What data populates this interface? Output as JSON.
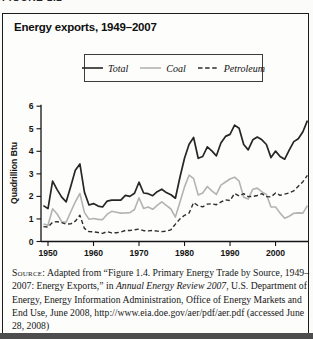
{
  "page": {
    "clipped_header": "FIGURE 1.2"
  },
  "figure": {
    "title": "Energy exports, 1949–2007",
    "y_axis_label": "Quadrillion Btu",
    "colors": {
      "total_line": "#262626",
      "coal_line": "#b3b3b3",
      "petroleum_line": "#2e2e2e",
      "border": "#1c1c1c",
      "bottom_rule": "#4d4d4d"
    },
    "legend": [
      {
        "label": "Total",
        "dash": "solid",
        "color": "#262626"
      },
      {
        "label": "Coal",
        "dash": "solid",
        "color": "#b3b3b3"
      },
      {
        "label": "Petroleum",
        "dash": "dashed",
        "color": "#2e2e2e"
      }
    ],
    "source_segments": [
      {
        "text": "Source:",
        "style": "smallcaps"
      },
      {
        "text": " Adapted from “Figure 1.4. Primary Energy Trade by Source, 1949–2007: Energy Exports,” in ",
        "style": "normal"
      },
      {
        "text": "Annual Energy Review 2007",
        "style": "italic"
      },
      {
        "text": ", U.S. Department of Energy, Energy Information Administration, Office of Energy Markets and End Use, June 2008, http://www.eia.doe.gov/aer/pdf/aer.pdf (accessed June 28, 2008)",
        "style": "normal"
      }
    ]
  },
  "chart_data": {
    "type": "line",
    "title": "Energy exports, 1949–2007",
    "xlabel": "",
    "ylabel": "Quadrillion Btu",
    "ylim": [
      0,
      6
    ],
    "xlim": [
      1949,
      2007
    ],
    "grid": false,
    "legend_position": "top-center",
    "x_ticks": [
      1950,
      1960,
      1970,
      1980,
      1990,
      2000
    ],
    "y_ticks": [
      0,
      1,
      2,
      3,
      4,
      5,
      6
    ],
    "x": [
      1949,
      1950,
      1951,
      1952,
      1953,
      1954,
      1955,
      1956,
      1957,
      1958,
      1959,
      1960,
      1961,
      1962,
      1963,
      1964,
      1965,
      1966,
      1967,
      1968,
      1969,
      1970,
      1971,
      1972,
      1973,
      1974,
      1975,
      1976,
      1977,
      1978,
      1979,
      1980,
      1981,
      1982,
      1983,
      1984,
      1985,
      1986,
      1987,
      1988,
      1989,
      1990,
      1991,
      1992,
      1993,
      1994,
      1995,
      1996,
      1997,
      1998,
      1999,
      2000,
      2001,
      2002,
      2003,
      2004,
      2005,
      2006,
      2007
    ],
    "series": [
      {
        "name": "Total",
        "color": "#262626",
        "dash": "solid",
        "values": [
          1.59,
          1.46,
          2.68,
          2.3,
          1.97,
          1.76,
          2.45,
          3.16,
          3.44,
          2.19,
          1.62,
          1.68,
          1.57,
          1.53,
          1.79,
          1.83,
          1.83,
          1.83,
          2.05,
          2.0,
          2.14,
          2.63,
          2.15,
          2.12,
          2.03,
          2.21,
          2.32,
          2.17,
          2.07,
          1.92,
          2.86,
          3.69,
          4.31,
          4.61,
          3.69,
          3.77,
          4.2,
          4.02,
          3.8,
          4.37,
          4.66,
          4.75,
          5.16,
          5.02,
          4.3,
          4.06,
          4.51,
          4.63,
          4.51,
          4.3,
          3.72,
          4.01,
          3.77,
          3.65,
          4.05,
          4.43,
          4.56,
          4.87,
          5.36
        ]
      },
      {
        "name": "Coal",
        "color": "#b3b3b3",
        "dash": "solid",
        "values": [
          0.78,
          0.72,
          1.45,
          1.22,
          0.88,
          0.86,
          1.32,
          1.76,
          2.13,
          1.29,
          0.99,
          1.02,
          0.98,
          0.97,
          1.21,
          1.34,
          1.3,
          1.26,
          1.27,
          1.28,
          1.42,
          1.94,
          1.47,
          1.53,
          1.43,
          1.6,
          1.76,
          1.6,
          1.44,
          1.08,
          1.75,
          2.42,
          2.94,
          2.79,
          2.06,
          2.15,
          2.44,
          2.25,
          2.09,
          2.5,
          2.64,
          2.77,
          2.85,
          2.68,
          1.96,
          1.88,
          2.32,
          2.37,
          2.2,
          2.09,
          1.53,
          1.53,
          1.26,
          1.03,
          1.12,
          1.25,
          1.27,
          1.26,
          1.59
        ]
      },
      {
        "name": "Petroleum",
        "color": "#2e2e2e",
        "dash": "dashed",
        "values": [
          0.66,
          0.64,
          0.86,
          0.88,
          0.84,
          0.77,
          0.78,
          0.9,
          1.16,
          0.58,
          0.44,
          0.43,
          0.4,
          0.36,
          0.44,
          0.38,
          0.39,
          0.42,
          0.49,
          0.49,
          0.52,
          0.55,
          0.48,
          0.47,
          0.49,
          0.46,
          0.44,
          0.46,
          0.52,
          0.77,
          1.0,
          1.16,
          1.26,
          1.73,
          1.58,
          1.54,
          1.66,
          1.67,
          1.63,
          1.75,
          1.85,
          1.82,
          2.13,
          2.02,
          2.12,
          1.99,
          2.0,
          2.04,
          2.12,
          1.99,
          1.98,
          2.15,
          2.05,
          2.1,
          2.15,
          2.25,
          2.45,
          2.65,
          2.93
        ]
      }
    ]
  }
}
